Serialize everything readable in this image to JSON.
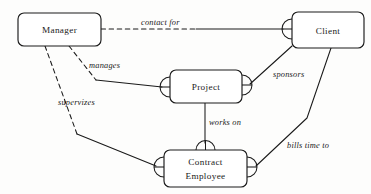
{
  "diagram": {
    "type": "er-diagram",
    "notation": "crow's-foot",
    "background_color": "#fdfdfc",
    "stroke_color": "#1a1a1a",
    "entities": [
      {
        "id": "manager",
        "label": "Manager",
        "line2": "",
        "x": 18,
        "y": 13,
        "width": 83,
        "height": 33
      },
      {
        "id": "client",
        "label": "Client",
        "line2": "",
        "x": 292,
        "y": 12,
        "width": 72,
        "height": 36
      },
      {
        "id": "project",
        "label": "Project",
        "line2": "",
        "x": 170,
        "y": 70,
        "width": 72,
        "height": 33
      },
      {
        "id": "contract_employee",
        "label": "Contract",
        "line2": "Employee",
        "x": 164,
        "y": 150,
        "width": 83,
        "height": 37
      }
    ],
    "relationships": [
      {
        "id": "contact-for",
        "label": "contact for",
        "from": "manager",
        "to": "client",
        "label_x": 141,
        "label_y": 25,
        "dashed_path": "M 101 29 L 196 29",
        "solid_path": "M 196 29 L 283 29",
        "crow_feet": [
          "client-left"
        ]
      },
      {
        "id": "manages",
        "label": "manages",
        "from": "manager",
        "to": "project",
        "label_x": 89,
        "label_y": 68,
        "dashed_path": "M 69 46 L 96 80",
        "solid_path": "M 96 80 L 162 87",
        "crow_feet": [
          "project-left"
        ]
      },
      {
        "id": "supervizes",
        "label": "supervizes",
        "from": "manager",
        "to": "contract_employee",
        "label_x": 58,
        "label_y": 105,
        "dashed_path": "M 45 46 L 77 134",
        "solid_path": "M 77 134 L 156 166",
        "crow_feet": [
          "contract-left"
        ]
      },
      {
        "id": "sponsors",
        "label": "sponsors",
        "from": "client",
        "to": "project",
        "label_x": 273,
        "label_y": 77,
        "dashed_path": "",
        "solid_path": "M 292 46 L 250 84",
        "crow_feet": [
          "project-right"
        ]
      },
      {
        "id": "works-on",
        "label": "works on",
        "from": "project",
        "to": "contract_employee",
        "label_x": 209,
        "label_y": 125,
        "dashed_path": "",
        "solid_path": "M 205 103 L 205 143",
        "crow_feet": [
          "contract-top"
        ]
      },
      {
        "id": "bills-time-to",
        "label": "bills time to",
        "from": "client",
        "to": "contract_employee",
        "label_x": 287,
        "label_y": 148,
        "dashed_path": "",
        "solid_path": "M 331 48 L 307 118 L 256 166",
        "crow_feet": [
          "contract-right"
        ]
      }
    ]
  }
}
